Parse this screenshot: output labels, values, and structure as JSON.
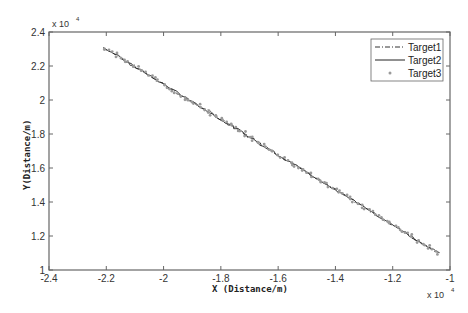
{
  "chart_data": {
    "type": "line",
    "title": "",
    "xlabel": "X (Distance/m)",
    "ylabel": "Y(Distance/m)",
    "x_multiplier_label": "x 10",
    "x_multiplier_exp": "4",
    "y_multiplier_label": "x 10",
    "y_multiplier_exp": "4",
    "scale": 10000,
    "xlim": [
      -2.4,
      -1.0
    ],
    "ylim": [
      1.0,
      2.4
    ],
    "xticks": [
      -2.4,
      -2.2,
      -2.0,
      -1.8,
      -1.6,
      -1.4,
      -1.2,
      -1.0
    ],
    "xtick_labels": [
      "-2.4",
      "-2.2",
      "-2",
      "-1.8",
      "-1.6",
      "-1.4",
      "-1.2",
      "-1"
    ],
    "yticks": [
      1.0,
      1.2,
      1.4,
      1.6,
      1.8,
      2.0,
      2.2,
      2.4
    ],
    "ytick_labels": [
      "1",
      "1.2",
      "1.4",
      "1.6",
      "1.8",
      "2",
      "2.2",
      "2.4"
    ],
    "grid": false,
    "legend_position": "top-right",
    "trajectory": {
      "x_start": -2.21,
      "y_start": 2.31,
      "x_end": -1.04,
      "y_end": 1.1,
      "samples": 120
    },
    "series": [
      {
        "name": "Target1",
        "style": "dash-dot",
        "color": "#333333",
        "noise": 0.012
      },
      {
        "name": "Target2",
        "style": "solid",
        "color": "#222222",
        "noise": 0.01
      },
      {
        "name": "Target3",
        "style": "marker",
        "color": "#9a9a9a",
        "noise": 0.018
      }
    ]
  }
}
